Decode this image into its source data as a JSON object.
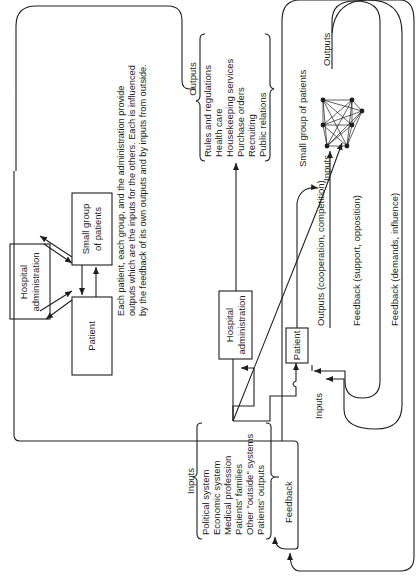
{
  "inset": {
    "nodes": {
      "hospital_admin": [
        "Hospital",
        "administration"
      ],
      "small_group": [
        "Small group",
        "of patients"
      ],
      "patient": "Patient"
    },
    "caption": [
      "Each patient, each group, and the administration provide",
      "outputs which are the inputs for the others. Each is influenced",
      "by the feedback of its own outputs and by inputs from outside."
    ]
  },
  "main": {
    "inputs": {
      "title": "Inputs",
      "items": [
        "Political system",
        "Economic system",
        "Medical profession",
        "Patients' families",
        "Other \"outside\" systems",
        "Patients' outputs"
      ]
    },
    "feedback_label": "Feedback",
    "hospital_admin": [
      "Hospital",
      "administration"
    ],
    "outputs": {
      "title": "Outputs",
      "items": [
        "Rules and regulations",
        "Health care",
        "Housekeeping services",
        "Purchase orders",
        "Recruiting",
        "Public relations"
      ]
    },
    "patient": "Patient",
    "patient_inputs_label": "Inputs",
    "patient_outputs_label": "Outputs (cooperation, competition)",
    "group_inputs_label": "Inputs",
    "small_group_label": "Small group of patients",
    "group_outputs_label": "Outputs",
    "feedback_support_label": "Feedback (support, opposition)",
    "feedback_demands_label": "Feedback (demands, influence)"
  }
}
